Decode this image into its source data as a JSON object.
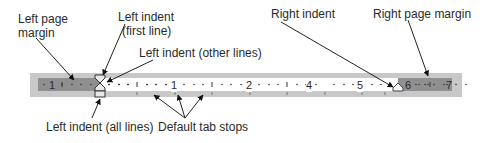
{
  "diagram": {
    "labels": {
      "left_page_margin_line1": "Left page",
      "left_page_margin_line2": "margin",
      "left_indent_first_line1": "Left indent",
      "left_indent_first_line2": "(first line)",
      "left_indent_other": "Left indent (other lines)",
      "right_indent": "Right indent",
      "right_page_margin": "Right page margin",
      "left_indent_all": "Left indent (all lines)",
      "default_tab_stops": "Default tab stops"
    },
    "ruler": {
      "left_margin_numbers": [
        "1"
      ],
      "page_numbers": [
        "1",
        "2",
        "3",
        "4",
        "5"
      ],
      "right_margin_numbers": [
        "6",
        "7"
      ],
      "colors": {
        "frame": "#c8c8c8",
        "margin": "#8f8f8f",
        "page": "#ffffff",
        "ticks": "#333333"
      }
    }
  }
}
